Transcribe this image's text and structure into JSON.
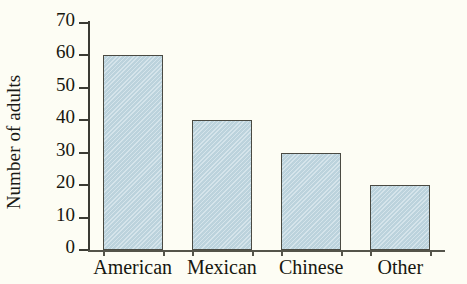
{
  "chart_data": {
    "type": "bar",
    "title": "",
    "subtitle": "",
    "xlabel": "",
    "ylabel": "Number of adults",
    "categories": [
      "American",
      "Mexican",
      "Chinese",
      "Other"
    ],
    "values": [
      60,
      40,
      30,
      20
    ],
    "ylim": [
      0,
      70
    ],
    "y_ticks": [
      0,
      10,
      20,
      30,
      40,
      50,
      60,
      70
    ],
    "y_tick_labels": [
      "0",
      "10",
      "20",
      "30",
      "40",
      "50",
      "60",
      "70"
    ],
    "grid": false,
    "legend": null,
    "legend_position": "none",
    "annotations": [],
    "colors": {
      "bar_fill": "#c3d9e2",
      "bar_border": "#4a4a42",
      "axis": "#3b3b33",
      "text": "#17170f",
      "background": "#fdfdf4"
    }
  },
  "axes": {
    "y_title": "Number of adults",
    "ticks": [
      {
        "label": "70",
        "value": 70
      },
      {
        "label": "60",
        "value": 60
      },
      {
        "label": "50",
        "value": 50
      },
      {
        "label": "40",
        "value": 40
      },
      {
        "label": "30",
        "value": 30
      },
      {
        "label": "20",
        "value": 20
      },
      {
        "label": "10",
        "value": 10
      },
      {
        "label": "0",
        "value": 0
      }
    ]
  },
  "bars": [
    {
      "label": "American",
      "value": 60
    },
    {
      "label": "Mexican",
      "value": 40
    },
    {
      "label": "Chinese",
      "value": 30
    },
    {
      "label": "Other",
      "value": 20
    }
  ]
}
